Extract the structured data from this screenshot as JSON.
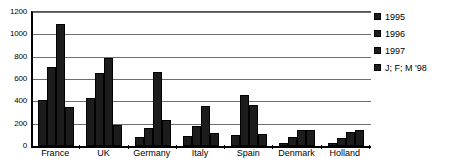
{
  "chart_data": {
    "type": "bar",
    "title": "",
    "xlabel": "",
    "ylabel": "",
    "ylim": [
      0,
      1200
    ],
    "ytick_step": 200,
    "yticks": [
      "1200",
      "1000",
      "800",
      "600",
      "400",
      "200",
      "0"
    ],
    "grid": true,
    "legend_position": "right",
    "categories": [
      "France",
      "UK",
      "Germany",
      "Italy",
      "Spain",
      "Denmark",
      "Holland"
    ],
    "series": [
      {
        "name": "1995",
        "values": [
          415,
          430,
          80,
          90,
          95,
          30,
          25
        ]
      },
      {
        "name": "1996",
        "values": [
          710,
          650,
          165,
          175,
          455,
          85,
          75
        ]
      },
      {
        "name": "1997",
        "values": [
          1090,
          790,
          665,
          360,
          370,
          145,
          125
        ]
      },
      {
        "name": "J; F; M '98",
        "values": [
          350,
          190,
          235,
          115,
          105,
          140,
          140
        ]
      }
    ]
  },
  "legend": {
    "entries": [
      {
        "label": "1995"
      },
      {
        "label": "1996"
      },
      {
        "label": "1997"
      },
      {
        "label": "J; F; M '98"
      }
    ]
  },
  "colors": {
    "bar": "#1c1c1c",
    "axis": "#000000",
    "gridline": "#6e6e6e",
    "background": "#ffffff"
  }
}
